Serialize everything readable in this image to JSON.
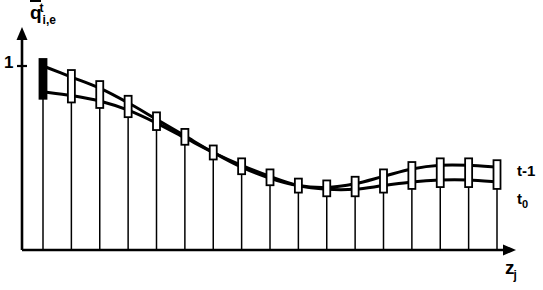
{
  "figure": {
    "title_implied": "",
    "y_axis_label": "q",
    "y_axis_superscript": "t",
    "y_axis_subscript": "i,e",
    "x_axis_label": "z",
    "x_axis_subscript": "j",
    "y_tick_label": "1",
    "curve_label_upper": "t-1",
    "curve_label_lower_base": "t",
    "curve_label_lower_sub": "0",
    "colors": {
      "ink": "#000000",
      "background": "#ffffff"
    }
  },
  "chart_data": {
    "type": "line",
    "title": "",
    "xlabel": "z_j",
    "ylabel": "q_i,e^t",
    "grid": false,
    "legend": "right-inline",
    "xlim": [
      0,
      18
    ],
    "ylim": [
      0,
      1.18
    ],
    "yticks": [
      1
    ],
    "ytick_labels": [
      "1"
    ],
    "x": [
      1,
      2,
      3,
      4,
      5,
      6,
      7,
      8,
      9,
      10,
      11,
      12,
      13,
      14,
      15,
      16,
      17
    ],
    "series": [
      {
        "name": "t-1",
        "label": "t-1",
        "values": [
          1.0,
          0.94,
          0.88,
          0.8,
          0.71,
          0.62,
          0.53,
          0.45,
          0.39,
          0.35,
          0.34,
          0.36,
          0.4,
          0.44,
          0.46,
          0.46,
          0.45
        ]
      },
      {
        "name": "t0",
        "label": "t0",
        "values": [
          0.86,
          0.84,
          0.81,
          0.76,
          0.69,
          0.61,
          0.53,
          0.46,
          0.4,
          0.35,
          0.33,
          0.33,
          0.35,
          0.37,
          0.38,
          0.38,
          0.37
        ]
      }
    ],
    "markers": {
      "style": "vertical-interval-box",
      "first_marker_filled": true,
      "description": "Narrow open rectangle spanning the interval between the two curves at each sample point, with a vertical stem dropping to the x-axis."
    },
    "stems": {
      "present": true,
      "from": "baseline",
      "to": "lower-curve"
    }
  }
}
